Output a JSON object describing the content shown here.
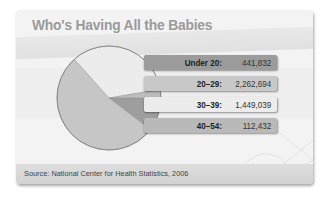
{
  "chart_data": {
    "type": "pie",
    "title": "Who's Having All the Babies",
    "categories": [
      "Under 20:",
      "20–29:",
      "30–39:",
      "40–54:"
    ],
    "values": [
      441832,
      2262694,
      1449039,
      112432
    ],
    "value_labels": [
      "441,832",
      "2,262,694",
      "1,449,039",
      "112,432"
    ],
    "colors": [
      "#9b9b9b",
      "#c4c4c4",
      "#e9e9e9",
      "#b7b7b7"
    ],
    "source": "Source: National Center for Health Statistics, 2006",
    "legend_position": "right"
  },
  "bars": [
    {
      "label": "Under 20:",
      "value": "441,832",
      "bg": "#9b9b9b"
    },
    {
      "label": "20–29:",
      "value": "2,262,694",
      "bg": "#c8c8c8"
    },
    {
      "label": "30–39:",
      "value": "1,449,039",
      "bg": "#e8e8e8"
    },
    {
      "label": "40–54:",
      "value": "112,432",
      "bg": "#b9b9b9"
    }
  ]
}
